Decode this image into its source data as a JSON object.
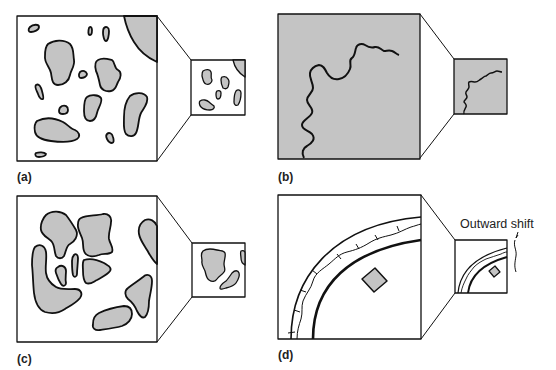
{
  "panels": [
    {
      "id": "a",
      "label": "(a)",
      "description": "Scattered small patches, enlarged view and reduced view"
    },
    {
      "id": "b",
      "label": "(b)",
      "description": "Large shaded area with meandering boundary"
    },
    {
      "id": "c",
      "label": "(c)",
      "description": "Clustered larger patches"
    },
    {
      "id": "d",
      "label": "(d)",
      "description": "Curved boundary lines with small rectangle",
      "annotation": "Outward shift"
    }
  ],
  "colors": {
    "fill": "#c4c4c4",
    "stroke": "#111111",
    "background": "#ffffff"
  }
}
